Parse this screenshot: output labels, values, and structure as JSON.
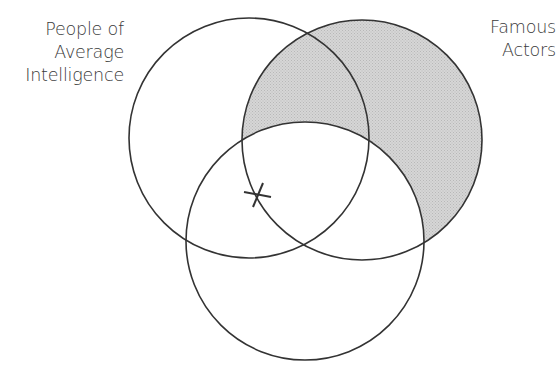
{
  "diagram": {
    "type": "venn",
    "sets": [
      {
        "id": "left",
        "label_lines": [
          "People of",
          "Average",
          "Intelligence"
        ],
        "cx": 249,
        "cy": 138,
        "r": 120,
        "shaded": false
      },
      {
        "id": "right",
        "label_lines": [
          "Famous",
          "Actors"
        ],
        "cx": 362,
        "cy": 140,
        "r": 120,
        "shaded": true
      },
      {
        "id": "bottom",
        "label_lines": [],
        "cx": 305,
        "cy": 241,
        "r": 119,
        "shaded": false
      }
    ],
    "shaded_region": "right minus bottom",
    "marker": {
      "symbol": "X",
      "x": 259,
      "y": 194
    },
    "colors": {
      "stroke": "#333333",
      "shade": "#cfcfcf",
      "text": "#3a3a3a",
      "background": "#ffffff"
    }
  }
}
